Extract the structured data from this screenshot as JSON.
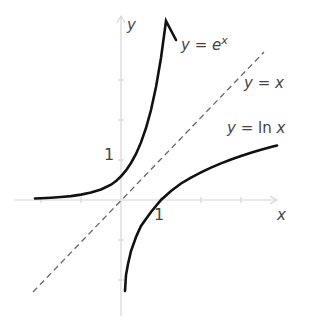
{
  "figure": {
    "axes": {
      "x_label": "x",
      "y_label": "y",
      "origin_px": [
        121,
        200
      ],
      "unit_px": 40
    },
    "ticks": {
      "x_one_label": "1",
      "y_one_label": "1"
    },
    "curves": [
      {
        "name": "exp",
        "label": "y = e^x",
        "label_main": "y = e",
        "label_sup": "x",
        "style": "solid",
        "color": "#111111"
      },
      {
        "name": "identity",
        "label": "y = x",
        "style": "dashed",
        "color": "#666666"
      },
      {
        "name": "ln",
        "label": "y = ln x",
        "style": "solid",
        "color": "#111111"
      }
    ],
    "colors": {
      "axis": "#d4d4d4",
      "curve": "#111111",
      "dash": "#666666",
      "text": "#444444"
    }
  }
}
